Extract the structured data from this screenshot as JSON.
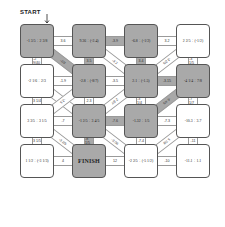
{
  "title": "START",
  "finish_label": "FINISH",
  "colors": {
    "path_fill": "#a9a9a9",
    "box_border": "#555555",
    "background": "#ffffff"
  },
  "boxes": [
    {
      "row": 0,
      "col": 0,
      "expr": "-1 3/5 ÷ 2 3/8",
      "path": true
    },
    {
      "row": 0,
      "col": 1,
      "expr": "9.36 ÷ (-2.4)",
      "path": true
    },
    {
      "row": 0,
      "col": 2,
      "expr": "-6.8 ÷ (-1/2)",
      "path": true
    },
    {
      "row": 0,
      "col": 3,
      "expr": "2 2/5 ÷ (-1/2)",
      "path": false
    },
    {
      "row": 1,
      "col": 0,
      "expr": "-2 1/6 ÷ 2/3",
      "path": false
    },
    {
      "row": 1,
      "col": 1,
      "expr": "-2.8 ÷ (-8/7)",
      "path": true
    },
    {
      "row": 1,
      "col": 2,
      "expr": "2.1 ÷ (-1.5)",
      "path": true
    },
    {
      "row": 1,
      "col": 3,
      "expr": "-4 1/4 ÷ 7/8",
      "path": true
    },
    {
      "row": 2,
      "col": 0,
      "expr": "3 3/5 ÷ 3 1/5",
      "path": false
    },
    {
      "row": 2,
      "col": 1,
      "expr": "-1 2/5 ÷ 3 4/5",
      "path": true
    },
    {
      "row": 2,
      "col": 2,
      "expr": "-1.32 ÷ 1/5",
      "path": true
    },
    {
      "row": 2,
      "col": 3,
      "expr": "-10.3 ÷ 3.7",
      "path": false
    },
    {
      "row": 3,
      "col": 0,
      "expr": "1 1/2 ÷ (-3 1/3)",
      "path": false
    },
    {
      "row": 3,
      "col": 1,
      "expr": "FINISH",
      "path": true,
      "finish": true
    },
    {
      "row": 3,
      "col": 2,
      "expr": "-2 2/5 ÷ (-5 1/2)",
      "path": false
    },
    {
      "row": 3,
      "col": 3,
      "expr": "-11.1 ÷ 1.1",
      "path": false
    }
  ],
  "horizontal_connectors": [
    {
      "row": 0,
      "between": [
        0,
        1
      ],
      "label": "3.6",
      "path": false
    },
    {
      "row": 0,
      "between": [
        1,
        2
      ],
      "label": "-3.9",
      "path": true
    },
    {
      "row": 0,
      "between": [
        2,
        3
      ],
      "label": "3.2",
      "path": false
    },
    {
      "row": 1,
      "between": [
        0,
        1
      ],
      "label": "-1.9",
      "path": false
    },
    {
      "row": 1,
      "between": [
        1,
        2
      ],
      "label": "-3.5",
      "path": false
    },
    {
      "row": 1,
      "between": [
        2,
        3
      ],
      "label": "-3.15",
      "path": true
    },
    {
      "row": 2,
      "between": [
        0,
        1
      ],
      "label": "-7",
      "path": false
    },
    {
      "row": 2,
      "between": [
        1,
        2
      ],
      "label": "-7.6",
      "path": true
    },
    {
      "row": 2,
      "between": [
        2,
        3
      ],
      "label": "-7.3",
      "path": false
    },
    {
      "row": 3,
      "between": [
        0,
        1
      ],
      "label": "4",
      "path": false
    },
    {
      "row": 3,
      "between": [
        1,
        2
      ],
      "label": "12",
      "path": false
    },
    {
      "row": 3,
      "between": [
        2,
        3
      ],
      "label": "-10",
      "path": false
    }
  ],
  "vertical_connectors": [
    {
      "col": 0,
      "between": [
        0,
        1
      ],
      "label": "-2 9/40",
      "path": false
    },
    {
      "col": 1,
      "between": [
        0,
        1
      ],
      "label": "3.5",
      "path": true
    },
    {
      "col": 2,
      "between": [
        0,
        1
      ],
      "label": "3.4",
      "path": true
    },
    {
      "col": 3,
      "between": [
        0,
        1
      ],
      "label": "-3 1/5",
      "path": false
    },
    {
      "col": 0,
      "between": [
        1,
        2
      ],
      "label": "3 1/4",
      "path": false
    },
    {
      "col": 1,
      "between": [
        1,
        2
      ],
      "label": "2.3",
      "path": false
    },
    {
      "col": 2,
      "between": [
        1,
        2
      ],
      "label": "-3 1/4",
      "path": false
    },
    {
      "col": 3,
      "between": [
        1,
        2
      ],
      "label": "-7 1/7",
      "path": false
    },
    {
      "col": 0,
      "between": [
        2,
        3
      ],
      "label": "3 1/5",
      "path": false
    },
    {
      "col": 1,
      "between": [
        2,
        3
      ],
      "label": "-8 1/5",
      "path": true
    },
    {
      "col": 2,
      "between": [
        2,
        3
      ],
      "label": "-7.4",
      "path": false
    },
    {
      "col": 3,
      "between": [
        2,
        3
      ],
      "label": "-11",
      "path": false
    }
  ],
  "diagonal_connectors": [
    {
      "from": [
        0,
        0
      ],
      "to": [
        1,
        1
      ],
      "label": "-2/3",
      "path": true
    },
    {
      "from": [
        0,
        1
      ],
      "to": [
        1,
        2
      ],
      "label": "-3.2",
      "path": false
    },
    {
      "from": [
        0,
        3
      ],
      "to": [
        1,
        2
      ],
      "label": "-3 2/5",
      "path": false
    },
    {
      "from": [
        1,
        0
      ],
      "to": [
        2,
        1
      ],
      "label": "3.5",
      "path": false
    },
    {
      "from": [
        1,
        2
      ],
      "to": [
        2,
        1
      ],
      "label": "2 3/7",
      "path": false
    },
    {
      "from": [
        1,
        3
      ],
      "to": [
        2,
        2
      ],
      "label": "-6 4/5",
      "path": true
    },
    {
      "from": [
        1,
        1
      ],
      "to": [
        2,
        0
      ],
      "label": "-2.5",
      "path": false
    },
    {
      "from": [
        2,
        0
      ],
      "to": [
        3,
        1
      ],
      "label": "-3 2/5",
      "path": false
    },
    {
      "from": [
        2,
        1
      ],
      "to": [
        3,
        2
      ],
      "label": "-3.06",
      "path": false
    },
    {
      "from": [
        2,
        3
      ],
      "to": [
        3,
        2
      ],
      "label": "5 7/8",
      "path": false
    }
  ]
}
